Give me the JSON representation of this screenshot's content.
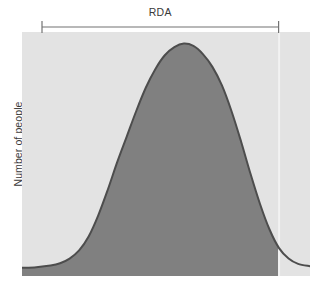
{
  "figure": {
    "kind": "distribution-curve-figure",
    "rda_label": "RDA",
    "y_axis_label": "Number of people"
  },
  "colors": {
    "plot_background": "#e3e3e3",
    "curve_fill": "#808080",
    "curve_stroke": "#4d4d4d",
    "bracket": "#737373",
    "rda_line": "#f2f2f2",
    "text": "#3a3a3a",
    "page_background": "#ffffff"
  },
  "chart_data": {
    "type": "area",
    "title": "RDA",
    "xlabel": "",
    "ylabel": "Number of people",
    "grid": false,
    "legend": null,
    "annotations": [
      {
        "name": "rda-bracket",
        "label": "RDA",
        "x_start": 0.0,
        "x_end": 1.0,
        "description": "Horizontal bracket spanning the intake range labelled RDA"
      },
      {
        "name": "rda-boundary-line",
        "label": "",
        "x": 1.0,
        "description": "Vertical line at the right edge of the RDA range where the shaded fill ends"
      }
    ],
    "xlim": [
      -0.08,
      1.13
    ],
    "ylim": [
      0,
      1.05
    ],
    "fill_clip_x": 1.0,
    "x": [
      -0.08,
      -0.02,
      0.04,
      0.08,
      0.12,
      0.16,
      0.2,
      0.24,
      0.28,
      0.32,
      0.36,
      0.4,
      0.44,
      0.48,
      0.52,
      0.56,
      0.6,
      0.64,
      0.68,
      0.72,
      0.76,
      0.8,
      0.84,
      0.88,
      0.92,
      0.96,
      1.0,
      1.04,
      1.08,
      1.13
    ],
    "series": [
      {
        "name": "Number of people",
        "values": [
          0.035,
          0.038,
          0.045,
          0.055,
          0.075,
          0.11,
          0.17,
          0.26,
          0.37,
          0.49,
          0.6,
          0.71,
          0.81,
          0.89,
          0.95,
          0.985,
          1.0,
          0.99,
          0.955,
          0.9,
          0.82,
          0.71,
          0.58,
          0.44,
          0.31,
          0.2,
          0.12,
          0.075,
          0.052,
          0.042
        ]
      }
    ]
  }
}
